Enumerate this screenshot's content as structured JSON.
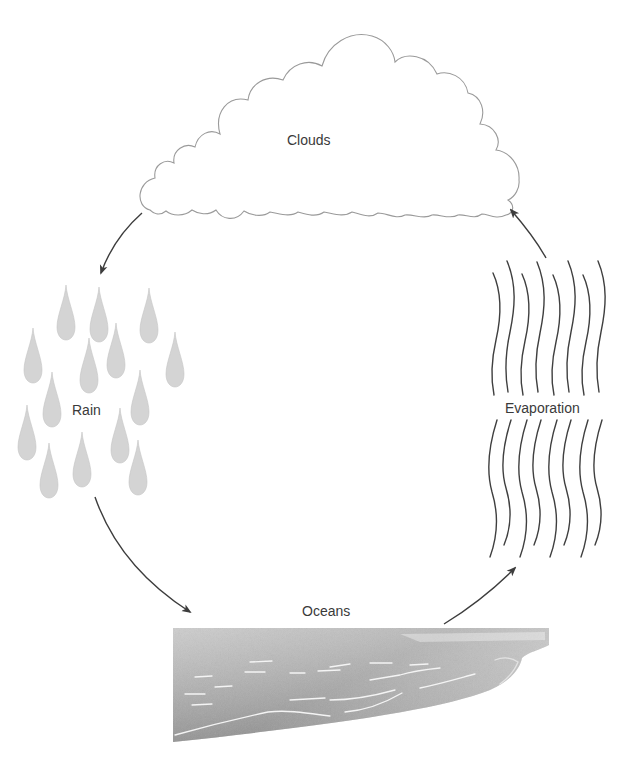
{
  "diagram": {
    "type": "water-cycle",
    "stages": {
      "clouds": {
        "label": "Clouds"
      },
      "rain": {
        "label": "Rain"
      },
      "oceans": {
        "label": "Oceans"
      },
      "evaporation": {
        "label": "Evaporation"
      }
    },
    "flow": [
      {
        "from": "Clouds",
        "to": "Rain"
      },
      {
        "from": "Rain",
        "to": "Oceans"
      },
      {
        "from": "Oceans",
        "to": "Evaporation"
      },
      {
        "from": "Evaporation",
        "to": "Clouds"
      }
    ],
    "colors": {
      "line": "#4a4a4a",
      "cloud_outline": "#9a9a9a",
      "raindrop": "#d2d2d2",
      "ocean_light": "#cfcfcf",
      "ocean_dark": "#8f8f8f",
      "text": "#3a3a3a"
    }
  }
}
